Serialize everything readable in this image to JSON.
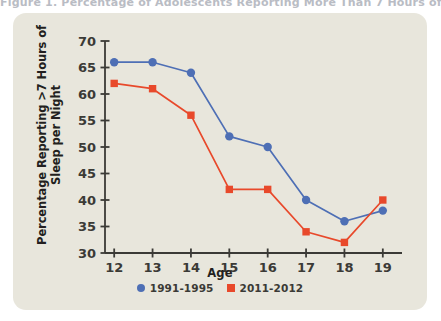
{
  "page": {
    "background_color": "#ffffff",
    "card_color": "#e8e6dc",
    "title_sliver": "Figure 1. Percentage of Adolescents Reporting More Than 7 Hours of Sleep"
  },
  "chart_data": {
    "type": "line",
    "title": "",
    "xlabel": "Age",
    "ylabel": "Percentage Reporting >7 Hours of\nSleep per Night",
    "categories": [
      "12",
      "13",
      "14",
      "15",
      "16",
      "17",
      "18",
      "19"
    ],
    "x": [
      12,
      13,
      14,
      15,
      16,
      17,
      18,
      19
    ],
    "xlim": [
      11.5,
      19.5
    ],
    "ylim": [
      30,
      70
    ],
    "yticks": [
      30,
      35,
      40,
      45,
      50,
      55,
      60,
      65,
      70
    ],
    "ytick_labels": [
      "30",
      "35",
      "40",
      "45",
      "50",
      "55",
      "60",
      "65",
      "70"
    ],
    "grid": false,
    "legend_position": "bottom-center",
    "series": [
      {
        "name": "1991-1995",
        "color": "#4e6fb5",
        "marker": "circle",
        "values": [
          66,
          66,
          64,
          52,
          50,
          40,
          36,
          38
        ]
      },
      {
        "name": "2011-2012",
        "color": "#e8492b",
        "marker": "square",
        "values": [
          62,
          61,
          56,
          42,
          42,
          34,
          32,
          40
        ]
      }
    ]
  },
  "axis": {
    "ylabel_line1": "Percentage Reporting >7 Hours of",
    "ylabel_line2": "Sleep per Night",
    "xlabel": "Age"
  },
  "legend": {
    "items": [
      {
        "label": "1991-1995",
        "color": "#4e6fb5",
        "marker": "circle"
      },
      {
        "label": "2011-2012",
        "color": "#e8492b",
        "marker": "square"
      }
    ]
  }
}
